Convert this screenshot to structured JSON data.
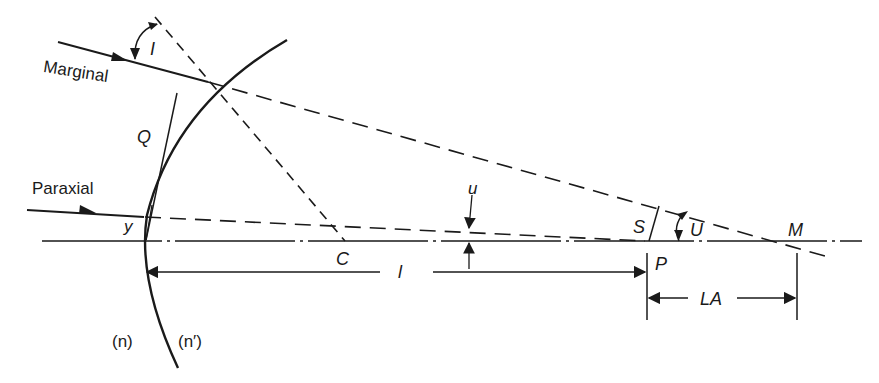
{
  "diagram": {
    "type": "optical-refraction-spherical-aberration",
    "colors": {
      "ink": "#1a1a1a",
      "background": "#ffffff"
    },
    "labels": {
      "marginal": "Marginal",
      "paraxial": "Paraxial",
      "angle_I": "I",
      "point_Q": "Q",
      "height_y": "y",
      "center_C": "C",
      "angle_u": "u",
      "distance_l": "l",
      "point_S": "S",
      "angle_U": "U",
      "point_M": "M",
      "point_P": "P",
      "longitudinal_aberration": "LA",
      "index_n": "(n)",
      "index_n_prime": "(n′)"
    }
  }
}
